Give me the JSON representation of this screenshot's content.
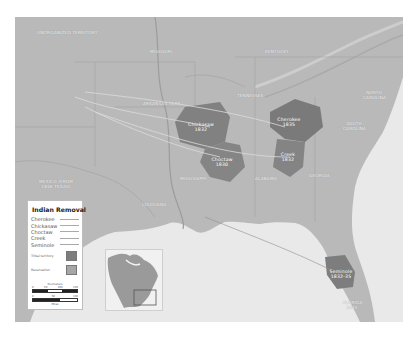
{
  "map": {
    "title": "Indian Removal",
    "colors": {
      "land": "#b7b7b7",
      "water": "#ececec",
      "tribal_territory": "#7d7d7d",
      "reservation": "#a6a6a6",
      "route": "#d8d8d8"
    },
    "region_labels": [
      {
        "id": "unorganized",
        "text": "Unorganized Territory",
        "x": 22,
        "y": 14
      },
      {
        "id": "missouri",
        "text": "MISSOURI",
        "x": 135,
        "y": 33
      },
      {
        "id": "kentucky",
        "text": "KENTUCKY",
        "x": 250,
        "y": 33
      },
      {
        "id": "arkansas",
        "text": "ARKANSAS TERR.",
        "x": 128,
        "y": 85
      },
      {
        "id": "tennessee",
        "text": "TENNESSEE",
        "x": 222,
        "y": 77
      },
      {
        "id": "north-carolina",
        "text": "NORTH CAROLINA",
        "x": 348,
        "y": 74
      },
      {
        "id": "south-carolina",
        "text": "SOUTH CAROLINA",
        "x": 328,
        "y": 105
      },
      {
        "id": "georgia",
        "text": "GEORGIA",
        "x": 294,
        "y": 157
      },
      {
        "id": "alabama",
        "text": "ALABAMA",
        "x": 240,
        "y": 160
      },
      {
        "id": "mississippi",
        "text": "MISSISSIPPI",
        "x": 165,
        "y": 160
      },
      {
        "id": "louisiana",
        "text": "LOUISIANA",
        "x": 127,
        "y": 186
      },
      {
        "id": "mexico",
        "text": "MEXICO (from 1846 Texas)",
        "x": 22,
        "y": 163
      },
      {
        "id": "florida",
        "text": "FLORIDA 1845",
        "x": 328,
        "y": 284
      }
    ],
    "tribe_labels": [
      {
        "id": "chickasaw",
        "text": "Chickasaw 1832",
        "x": 187,
        "y": 105
      },
      {
        "id": "cherokee",
        "text": "Cherokee 1835",
        "x": 268,
        "y": 104
      },
      {
        "id": "choctaw",
        "text": "Choctaw 1830",
        "x": 205,
        "y": 144
      },
      {
        "id": "creek",
        "text": "Creek 1832",
        "x": 268,
        "y": 137
      },
      {
        "id": "seminole",
        "text": "Seminole 1832-35",
        "x": 318,
        "y": 256
      }
    ]
  },
  "legend": {
    "title": "Indian Removal",
    "tribes": [
      {
        "name": "Cherokee"
      },
      {
        "name": "Chickasaw"
      },
      {
        "name": "Choctaw"
      },
      {
        "name": "Creek"
      },
      {
        "name": "Seminole"
      }
    ],
    "swatches": [
      {
        "label": "Tribal territory",
        "color": "#7d7d7d"
      },
      {
        "label": "Reservation",
        "color": "#a6a6a6"
      }
    ],
    "scale": {
      "km_label": "Kilometers",
      "km_ticks": [
        "0",
        "50",
        "100",
        "150"
      ],
      "mi_label": "Miles",
      "mi_ticks": [
        "0",
        "50",
        "100"
      ]
    }
  },
  "inset": {
    "description": "North America locator"
  }
}
